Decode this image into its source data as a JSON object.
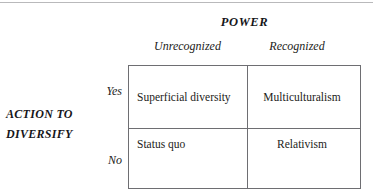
{
  "diagram": {
    "type": "2x2-matrix",
    "column_axis": {
      "title": "POWER",
      "headers": [
        "Unrecognized",
        "Recognized"
      ]
    },
    "row_axis": {
      "title_line1": "ACTION TO",
      "title_line2": "DIVERSIFY",
      "headers": [
        "Yes",
        "No"
      ]
    },
    "cells": [
      {
        "row": "Yes",
        "column": "Unrecognized",
        "label": "Superficial diversity"
      },
      {
        "row": "Yes",
        "column": "Recognized",
        "label": "Multiculturalism"
      },
      {
        "row": "No",
        "column": "Unrecognized",
        "label": "Status quo"
      },
      {
        "row": "No",
        "column": "Recognized",
        "label": "Relativism"
      }
    ],
    "colors": {
      "border": "#6e6e72",
      "text": "#1c1c20",
      "top_rule": "#b9b9bb",
      "background": "#ffffff"
    }
  }
}
